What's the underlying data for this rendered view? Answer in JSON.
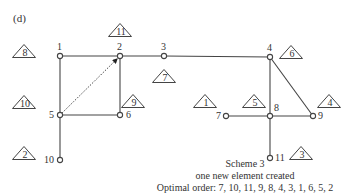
{
  "panel_label": "(d)",
  "nodes": [
    {
      "id": "1",
      "x": 60,
      "y": 56
    },
    {
      "id": "2",
      "x": 120,
      "y": 56
    },
    {
      "id": "3",
      "x": 164,
      "y": 56
    },
    {
      "id": "4",
      "x": 270,
      "y": 57
    },
    {
      "id": "5",
      "x": 60,
      "y": 115
    },
    {
      "id": "6",
      "x": 120,
      "y": 115
    },
    {
      "id": "7",
      "x": 226,
      "y": 116
    },
    {
      "id": "8",
      "x": 270,
      "y": 116
    },
    {
      "id": "9",
      "x": 313,
      "y": 116
    },
    {
      "id": "10",
      "x": 60,
      "y": 160
    },
    {
      "id": "11",
      "x": 270,
      "y": 158
    }
  ],
  "edges": [
    {
      "from": "1",
      "to": "2"
    },
    {
      "from": "2",
      "to": "3"
    },
    {
      "from": "3",
      "to": "4"
    },
    {
      "from": "1",
      "to": "5"
    },
    {
      "from": "2",
      "to": "6"
    },
    {
      "from": "5",
      "to": "6"
    },
    {
      "from": "5",
      "to": "10"
    },
    {
      "from": "4",
      "to": "8"
    },
    {
      "from": "4",
      "to": "9"
    },
    {
      "from": "7",
      "to": "8"
    },
    {
      "from": "8",
      "to": "9"
    },
    {
      "from": "8",
      "to": "11"
    }
  ],
  "new_element": {
    "from": "5",
    "to": "2",
    "style": "dotted-arrow"
  },
  "elimination_markers": [
    {
      "num": "11",
      "x": 120,
      "y": 30
    },
    {
      "num": "8",
      "x": 24,
      "y": 51
    },
    {
      "num": "7",
      "x": 164,
      "y": 76
    },
    {
      "num": "6",
      "x": 291,
      "y": 52
    },
    {
      "num": "10",
      "x": 24,
      "y": 102
    },
    {
      "num": "9",
      "x": 133,
      "y": 101
    },
    {
      "num": "1",
      "x": 205,
      "y": 101
    },
    {
      "num": "5",
      "x": 254,
      "y": 101
    },
    {
      "num": "4",
      "x": 329,
      "y": 101
    },
    {
      "num": "2",
      "x": 24,
      "y": 153
    },
    {
      "num": "3",
      "x": 301,
      "y": 153
    }
  ],
  "caption": {
    "line1": "Scheme 3",
    "line2": "one new element created",
    "line3": "Optimal order: 7, 10, 11, 9, 8, 4, 3, 1, 6, 5, 2"
  }
}
